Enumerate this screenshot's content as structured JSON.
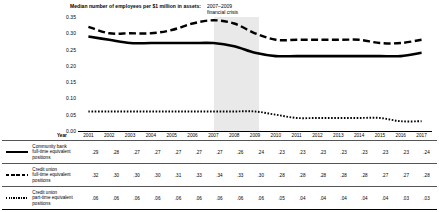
{
  "chart_data": {
    "type": "line",
    "title": "Median number of employees per $1 million in assets:",
    "xlabel": "Year",
    "ylabel": "",
    "ylim": [
      0.0,
      0.35
    ],
    "yticks": [
      "0.35",
      "0.30",
      "0.25",
      "0.20",
      "0.15",
      "0.10",
      "0.05",
      "0.00"
    ],
    "grid": false,
    "legend_position": "table-below",
    "annotations": [
      {
        "text": "2007–2009 financial crisis",
        "line1": "2007–2009",
        "line2": "financial crisis",
        "span_start": "2007",
        "span_end": "2009",
        "band_color": "#e9e9e9"
      }
    ],
    "categories": [
      "2001",
      "2002",
      "2003",
      "2004",
      "2005",
      "2006",
      "2007",
      "2008",
      "2009",
      "2010",
      "2011",
      "2012",
      "2013",
      "2014",
      "2015",
      "2016",
      "2017"
    ],
    "series": [
      {
        "name": "Community bank full-time equivalent positions",
        "label_line1": "Community bank",
        "label_line2": "full-time equivalent",
        "label_line3": "positions",
        "style": "solid",
        "color": "#000000",
        "values": [
          0.29,
          0.28,
          0.27,
          0.27,
          0.27,
          0.27,
          0.27,
          0.26,
          0.24,
          0.23,
          0.23,
          0.23,
          0.23,
          0.23,
          0.23,
          0.23,
          0.24
        ],
        "display_values": [
          ".29",
          ".28",
          ".27",
          ".27",
          ".27",
          ".27",
          ".27",
          ".26",
          ".24",
          ".23",
          ".23",
          ".23",
          ".23",
          ".23",
          ".23",
          ".23",
          ".24"
        ]
      },
      {
        "name": "Credit union full-time equivalent positions",
        "label_line1": "Credit union",
        "label_line2": "full-time equivalent",
        "label_line3": "positions",
        "style": "dashed",
        "color": "#000000",
        "values": [
          0.32,
          0.3,
          0.3,
          0.3,
          0.31,
          0.33,
          0.34,
          0.33,
          0.3,
          0.28,
          0.28,
          0.28,
          0.28,
          0.28,
          0.27,
          0.27,
          0.28
        ],
        "display_values": [
          ".32",
          ".30",
          ".30",
          ".30",
          ".31",
          ".33",
          ".34",
          ".33",
          ".30",
          ".28",
          ".28",
          ".28",
          ".28",
          ".28",
          ".27",
          ".27",
          ".28"
        ]
      },
      {
        "name": "Credit union part-time equivalent positions",
        "label_line1": "Credit union",
        "label_line2": "part-time equivalent",
        "label_line3": "positions",
        "style": "dotted",
        "color": "#000000",
        "values": [
          0.06,
          0.06,
          0.06,
          0.06,
          0.06,
          0.06,
          0.06,
          0.06,
          0.06,
          0.05,
          0.04,
          0.04,
          0.04,
          0.04,
          0.04,
          0.03,
          0.03
        ],
        "display_values": [
          ".06",
          ".06",
          ".06",
          ".06",
          ".06",
          ".06",
          ".06",
          ".06",
          ".06",
          ".05",
          ".04",
          ".04",
          ".04",
          ".04",
          ".04",
          ".03",
          ".03"
        ]
      }
    ]
  }
}
